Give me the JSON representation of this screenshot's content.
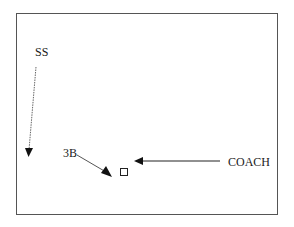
{
  "diagram": {
    "type": "play-diagram",
    "frame": {
      "border_color": "#555555"
    },
    "labels": {
      "ss": "SS",
      "third_base": "3B",
      "coach": "COACH"
    },
    "arrows": [
      {
        "from": "SS",
        "direction": "down",
        "style": "thin-dotted",
        "color": "#555555"
      },
      {
        "from": "3B",
        "direction": "down-right",
        "target": "base",
        "style": "solid",
        "color": "#444444"
      },
      {
        "from": "COACH",
        "direction": "left",
        "target": "base",
        "style": "solid",
        "color": "#222222"
      }
    ],
    "markers": [
      {
        "name": "base",
        "shape": "square"
      }
    ]
  }
}
